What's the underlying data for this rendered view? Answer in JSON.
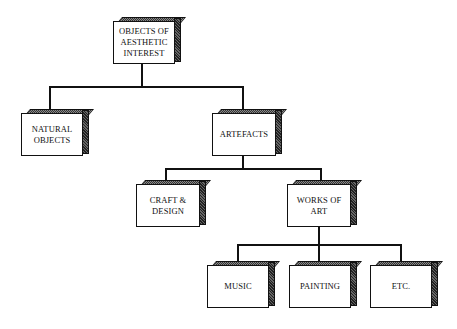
{
  "diagram": {
    "title": "",
    "nodes": [
      {
        "id": "root",
        "label": "OBJECTS OF AESTHETIC INTEREST",
        "lines": [
          "OBJECTS OF",
          "AESTHETIC",
          "INTEREST"
        ]
      },
      {
        "id": "natural",
        "label": "NATURAL OBJECTS",
        "lines": [
          "NATURAL",
          "OBJECTS"
        ]
      },
      {
        "id": "artefacts",
        "label": "ARTEFACTS",
        "lines": [
          "ARTEFACTS"
        ]
      },
      {
        "id": "craft",
        "label": "CRAFT & DESIGN",
        "lines": [
          "CRAFT &",
          "DESIGN"
        ]
      },
      {
        "id": "works",
        "label": "WORKS OF ART",
        "lines": [
          "WORKS OF",
          "ART"
        ]
      },
      {
        "id": "music",
        "label": "MUSIC",
        "lines": [
          "MUSIC"
        ]
      },
      {
        "id": "painting",
        "label": "PAINTING",
        "lines": [
          "PAINTING"
        ]
      },
      {
        "id": "etc",
        "label": "ETC.",
        "lines": [
          "ETC."
        ]
      }
    ],
    "edges": [
      {
        "from": "root",
        "to": "natural"
      },
      {
        "from": "root",
        "to": "artefacts"
      },
      {
        "from": "artefacts",
        "to": "craft"
      },
      {
        "from": "artefacts",
        "to": "works"
      },
      {
        "from": "works",
        "to": "music"
      },
      {
        "from": "works",
        "to": "painting"
      },
      {
        "from": "works",
        "to": "etc"
      }
    ]
  }
}
